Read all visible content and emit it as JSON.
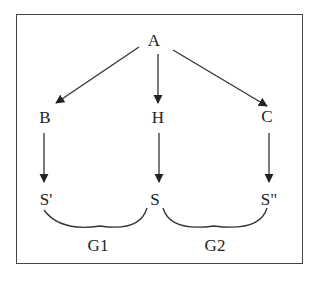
{
  "diagram": {
    "nodes": {
      "A": "A",
      "B": "B",
      "H": "H",
      "C": "C",
      "S_prime": "S'",
      "S": "S",
      "S_double_prime": "S\""
    },
    "groups": {
      "G1": "G1",
      "G2": "G2"
    },
    "edges": [
      {
        "from": "A",
        "to": "B"
      },
      {
        "from": "A",
        "to": "H"
      },
      {
        "from": "A",
        "to": "C"
      },
      {
        "from": "B",
        "to": "S'"
      },
      {
        "from": "H",
        "to": "S"
      },
      {
        "from": "C",
        "to": "S\""
      }
    ],
    "brackets": [
      {
        "label": "G1",
        "spans": [
          "S'",
          "S"
        ]
      },
      {
        "label": "G2",
        "spans": [
          "S",
          "S\""
        ]
      }
    ],
    "colors": {
      "line": "#333333",
      "border": "#444444",
      "background": "#ffffff"
    }
  }
}
